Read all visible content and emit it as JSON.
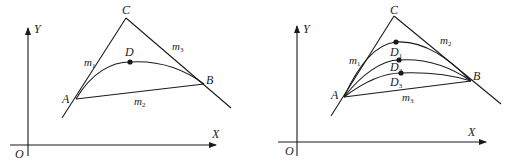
{
  "figures": [
    {
      "id": "left",
      "axes": {
        "origin": "O",
        "x": "X",
        "y": "Y"
      },
      "points": {
        "A": "A",
        "B": "B",
        "C": "C",
        "D": "D"
      },
      "lines": {
        "left_edge": {
          "name": "m",
          "sub": "1"
        },
        "right_edge": {
          "name": "m",
          "sub": "3"
        },
        "chord": {
          "name": "m",
          "sub": "2"
        }
      }
    },
    {
      "id": "right",
      "axes": {
        "origin": "O",
        "x": "X",
        "y": "Y"
      },
      "points": {
        "A": "A",
        "B": "B",
        "C": "C"
      },
      "curve_points": [
        {
          "name": "D",
          "sub": "1"
        },
        {
          "name": "D",
          "sub": "2"
        },
        {
          "name": "D",
          "sub": "3"
        }
      ],
      "lines": {
        "left_edge": {
          "name": "m",
          "sub": "1"
        },
        "right_edge": {
          "name": "m",
          "sub": "2"
        },
        "chord": {
          "name": "m",
          "sub": "3"
        }
      }
    }
  ],
  "colors": {
    "stroke": "#1a1a1a",
    "text": "#222222"
  }
}
